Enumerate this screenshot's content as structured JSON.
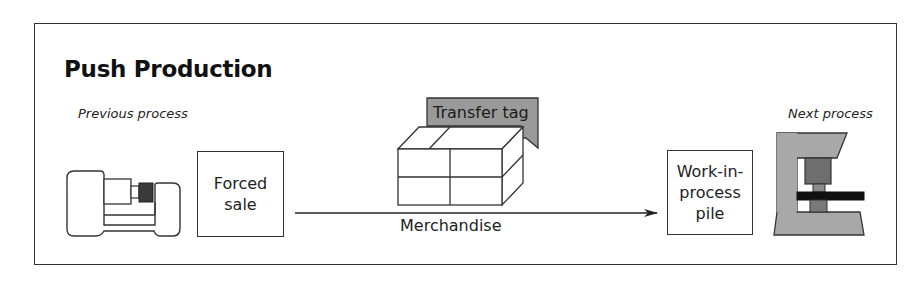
{
  "diagram": {
    "title": "Push Production",
    "previous_process_label": "Previous process",
    "next_process_label": "Next process",
    "forced_sale_label": "Forced\nsale",
    "transfer_tag_label": "Transfer tag",
    "flow_label": "Merchandise",
    "wip_label": "Work-in-\nprocess\npile",
    "colors": {
      "line": "#333333",
      "tag_fill": "#9a9a9a",
      "machine_fill": "#a8a8a8",
      "machine_dark": "#6e6e6e",
      "tool_dark": "#444444",
      "bar_black": "#111111"
    },
    "nodes": [
      {
        "id": "previous-process-machine",
        "type": "lathe-icon"
      },
      {
        "id": "forced-sale",
        "type": "box"
      },
      {
        "id": "merchandise",
        "type": "stacked-boxes-icon"
      },
      {
        "id": "wip-pile",
        "type": "box"
      },
      {
        "id": "next-process-machine",
        "type": "press-icon"
      }
    ],
    "edges": [
      {
        "from": "forced-sale",
        "to": "wip-pile",
        "label": "Merchandise"
      }
    ]
  }
}
